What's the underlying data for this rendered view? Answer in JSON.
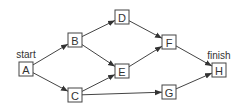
{
  "diagram": {
    "type": "directed-graph",
    "nodes": [
      {
        "id": "A",
        "label": "A",
        "x": 26,
        "y": 69
      },
      {
        "id": "B",
        "label": "B",
        "x": 75,
        "y": 40
      },
      {
        "id": "C",
        "label": "C",
        "x": 75,
        "y": 95
      },
      {
        "id": "D",
        "label": "D",
        "x": 122,
        "y": 17
      },
      {
        "id": "E",
        "label": "E",
        "x": 122,
        "y": 71
      },
      {
        "id": "F",
        "label": "F",
        "x": 169,
        "y": 42
      },
      {
        "id": "G",
        "label": "G",
        "x": 169,
        "y": 92
      },
      {
        "id": "H",
        "label": "H",
        "x": 219,
        "y": 70
      }
    ],
    "edges": [
      {
        "from": "A",
        "to": "B"
      },
      {
        "from": "A",
        "to": "C"
      },
      {
        "from": "B",
        "to": "D"
      },
      {
        "from": "B",
        "to": "E"
      },
      {
        "from": "C",
        "to": "E"
      },
      {
        "from": "C",
        "to": "G"
      },
      {
        "from": "D",
        "to": "F"
      },
      {
        "from": "E",
        "to": "F"
      },
      {
        "from": "F",
        "to": "H"
      },
      {
        "from": "G",
        "to": "H"
      }
    ],
    "annotations": {
      "start": "start",
      "finish": "finish"
    },
    "colors": {
      "stroke": "#444444",
      "text": "#333333",
      "background": "#ffffff"
    }
  }
}
